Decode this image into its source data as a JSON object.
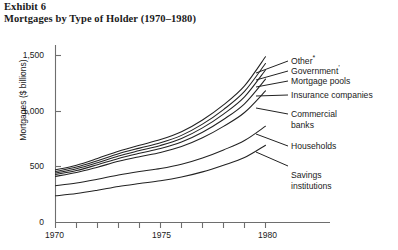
{
  "header": {
    "exhibit_number": "Exhibit 6",
    "title": "Mortgages by Type of Holder (1970–1980)"
  },
  "chart_data": {
    "type": "line",
    "title": "Mortgages by Type of Holder (1970–1980)",
    "xlabel": "",
    "ylabel": "Mortgages ($ billions)",
    "xlim": [
      1970,
      1981
    ],
    "ylim": [
      0,
      1600
    ],
    "grid": false,
    "legend_position": "right-inline-labels",
    "yticks": [
      0,
      500,
      1000,
      1500
    ],
    "ytick_labels": [
      "0",
      "500",
      "1,000",
      "1,500"
    ],
    "xticks": [
      1970,
      1971,
      1972,
      1973,
      1974,
      1975,
      1976,
      1977,
      1978,
      1979,
      1980
    ],
    "xtick_labels_shown": [
      "1970",
      "1975",
      "1980"
    ],
    "x": [
      1970,
      1971,
      1972,
      1973,
      1974,
      1975,
      1976,
      1977,
      1978,
      1979,
      1980
    ],
    "note": "Cumulative stacked bands; each line is a running total of holder categories.",
    "series": [
      {
        "name": "Other*",
        "label": "Other",
        "marker": "*",
        "values": [
          470,
          512,
          572,
          637,
          690,
          740,
          810,
          915,
          1050,
          1220,
          1480
        ]
      },
      {
        "name": "Government†",
        "label": "Government",
        "marker": "†",
        "values": [
          455,
          495,
          552,
          614,
          664,
          712,
          778,
          878,
          1008,
          1170,
          1420
        ]
      },
      {
        "name": "Mortgage pools",
        "label": "Mortgage pools",
        "marker": "",
        "values": [
          442,
          480,
          534,
          594,
          642,
          688,
          750,
          845,
          968,
          1122,
          1362
        ]
      },
      {
        "name": "Insurance companies",
        "label": "Insurance companies",
        "marker": "",
        "values": [
          428,
          464,
          516,
          572,
          618,
          660,
          718,
          806,
          920,
          1060,
          1280
        ]
      },
      {
        "name": "Commercial banks",
        "label": "Commercial banks",
        "marker": "",
        "values": [
          412,
          446,
          494,
          546,
          588,
          626,
          678,
          756,
          858,
          982,
          1175
        ]
      },
      {
        "name": "Households",
        "label": "Households",
        "marker": "",
        "values": [
          328,
          352,
          386,
          424,
          455,
          482,
          520,
          576,
          648,
          732,
          860
        ]
      },
      {
        "name": "Savings institutions",
        "label": "Savings institutions",
        "marker": "",
        "values": [
          238,
          258,
          288,
          322,
          348,
          372,
          406,
          452,
          512,
          580,
          690
        ]
      }
    ]
  },
  "labels": {
    "other": "Other",
    "other_marker": "*",
    "government": "Government",
    "government_marker": "’",
    "mortgage_pools": "Mortgage pools",
    "insurance_companies": "Insurance companies",
    "commercial_banks_l1": "Commercial",
    "commercial_banks_l2": "banks",
    "households": "Households",
    "savings_l1": "Savings",
    "savings_l2": "institutions"
  },
  "axis": {
    "y_title": "Mortgages ($ billions)",
    "y_ticks": [
      "1,500",
      "1,000",
      "500",
      "0"
    ],
    "x_ticks": [
      "1970",
      "1975",
      "1980"
    ]
  }
}
